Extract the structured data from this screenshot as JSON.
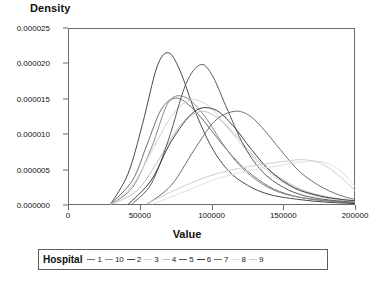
{
  "chart_data": {
    "type": "line",
    "title": "",
    "xlabel": "Value",
    "ylabel": "Density",
    "xlim": [
      0,
      200000
    ],
    "ylim": [
      0,
      2.5e-05
    ],
    "grid": false,
    "legend_position": "bottom",
    "legend_title": "Hospital",
    "xticks": [
      "0",
      "50000",
      "100000",
      "150000",
      "200000"
    ],
    "xtick_values": [
      0,
      50000,
      100000,
      150000,
      200000
    ],
    "yticks": [
      "0.000000",
      "0.000005",
      "0.000010",
      "0.000015",
      "0.000020",
      "0.000025"
    ],
    "ytick_values": [
      0.0,
      5e-06,
      1e-05,
      1.5e-05,
      2e-05,
      2.5e-05
    ],
    "series": [
      {
        "name": "1",
        "color": "#6e6e6e",
        "x": [
          30000,
          45000,
          55000,
          65000,
          75000,
          85000,
          95000,
          105000,
          115000,
          125000,
          140000,
          155000,
          170000,
          185000,
          200000
        ],
        "values": [
          2e-07,
          3.5e-06,
          8.5e-06,
          1.35e-05,
          1.51e-05,
          1.4e-05,
          1.18e-05,
          9.2e-06,
          6.8e-06,
          4.8e-06,
          2.6e-06,
          1.4e-06,
          8e-07,
          5e-07,
          3e-07
        ]
      },
      {
        "name": "10",
        "color": "#8a8a8a",
        "x": [
          30000,
          45000,
          58000,
          70000,
          82000,
          95000,
          108000,
          120000,
          135000,
          150000,
          165000,
          180000,
          200000
        ],
        "values": [
          1e-07,
          2.5e-06,
          8e-06,
          1.45e-05,
          1.52e-05,
          1.26e-05,
          8.6e-06,
          5.5e-06,
          3e-06,
          1.6e-06,
          1e-06,
          6e-07,
          3e-07
        ]
      },
      {
        "name": "2",
        "color": "#4a4a4a",
        "x": [
          30000,
          42000,
          52000,
          62000,
          70000,
          78000,
          88000,
          100000,
          112000,
          125000,
          140000,
          160000,
          180000,
          200000
        ],
        "values": [
          2e-07,
          4.5e-06,
          1.15e-05,
          1.95e-05,
          2.15e-05,
          1.9e-05,
          1.35e-05,
          8.2e-06,
          4.8e-06,
          2.8e-06,
          1.5e-06,
          8e-07,
          4e-07,
          2e-07
        ]
      },
      {
        "name": "3",
        "color": "#d2d2d2",
        "x": [
          30000,
          45000,
          58000,
          72000,
          85000,
          98000,
          110000,
          125000,
          140000,
          155000,
          170000,
          185000,
          200000
        ],
        "values": [
          1e-07,
          2.8e-06,
          7.5e-06,
          1.25e-05,
          1.48e-05,
          1.4e-05,
          1.12e-05,
          7.6e-06,
          4.6e-06,
          2.6e-06,
          1.4e-06,
          8e-07,
          4e-07
        ]
      },
      {
        "name": "4",
        "color": "#bfbfbf",
        "x": [
          30000,
          48000,
          62000,
          78000,
          92000,
          105000,
          118000,
          132000,
          148000,
          165000,
          182000,
          200000
        ],
        "values": [
          1e-07,
          2e-06,
          6e-06,
          1.12e-05,
          1.32e-05,
          1.22e-05,
          9.6e-06,
          6.4e-06,
          3.8e-06,
          2e-06,
          1.1e-06,
          6e-07
        ]
      },
      {
        "name": "5",
        "color": "#5a5a5a",
        "x": [
          45000,
          58000,
          70000,
          82000,
          92000,
          100000,
          110000,
          122000,
          135000,
          150000,
          165000,
          182000,
          200000
        ],
        "values": [
          2e-07,
          3e-06,
          9.2e-06,
          1.7e-05,
          1.98e-05,
          1.85e-05,
          1.4e-05,
          8.6e-06,
          4.8e-06,
          2.5e-06,
          1.3e-06,
          7e-07,
          4e-07
        ]
      },
      {
        "name": "6",
        "color": "#3d3d3d",
        "x": [
          42000,
          58000,
          72000,
          88000,
          102000,
          115000,
          128000,
          142000,
          158000,
          175000,
          190000,
          200000
        ],
        "values": [
          1e-07,
          3.5e-06,
          9e-06,
          1.32e-05,
          1.35e-05,
          1.12e-05,
          7.8e-06,
          4.6e-06,
          2.4e-06,
          1.3e-06,
          8e-07,
          6e-07
        ]
      },
      {
        "name": "7",
        "color": "#707070",
        "x": [
          55000,
          72000,
          88000,
          102000,
          115000,
          125000,
          135000,
          148000,
          162000,
          178000,
          192000,
          200000
        ],
        "values": [
          1e-07,
          2.8e-06,
          7.8e-06,
          1.18e-05,
          1.32e-05,
          1.28e-05,
          1.1e-05,
          7.8e-06,
          4.6e-06,
          2.4e-06,
          1.2e-06,
          8e-07
        ]
      },
      {
        "name": "8",
        "color": "#e0e0e0",
        "x": [
          60000,
          85000,
          105000,
          125000,
          145000,
          160000,
          172000,
          182000,
          190000,
          196000,
          200000
        ],
        "values": [
          2e-07,
          2.2e-06,
          3.8e-06,
          4.8e-06,
          5.5e-06,
          6e-06,
          6.2e-06,
          5.8e-06,
          4.8e-06,
          3.6e-06,
          2.6e-06
        ]
      },
      {
        "name": "9",
        "color": "#cfcfcf",
        "x": [
          55000,
          80000,
          100000,
          120000,
          138000,
          152000,
          164000,
          176000,
          186000,
          194000,
          200000
        ],
        "values": [
          2e-07,
          2.6e-06,
          4.2e-06,
          5.2e-06,
          5.8e-06,
          6.2e-06,
          6.4e-06,
          5.9e-06,
          4.6e-06,
          3.2e-06,
          2e-06
        ]
      }
    ]
  },
  "legend": {
    "title": "Hospital",
    "entries": [
      {
        "label": "1",
        "color": "#6e6e6e"
      },
      {
        "label": "10",
        "color": "#8a8a8a"
      },
      {
        "label": "2",
        "color": "#4a4a4a"
      },
      {
        "label": "3",
        "color": "#d2d2d2"
      },
      {
        "label": "4",
        "color": "#bfbfbf"
      },
      {
        "label": "5",
        "color": "#5a5a5a"
      },
      {
        "label": "6",
        "color": "#3d3d3d"
      },
      {
        "label": "7",
        "color": "#707070"
      },
      {
        "label": "8",
        "color": "#e0e0e0"
      },
      {
        "label": "9",
        "color": "#cfcfcf"
      }
    ]
  }
}
